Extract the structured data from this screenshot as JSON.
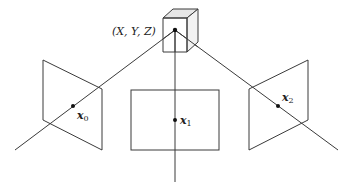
{
  "diagram": {
    "type": "multi-view camera geometry",
    "world_point": {
      "label": "(X, Y, Z)"
    },
    "views": [
      {
        "name": "view-0",
        "point_label": "x",
        "subscript": "0"
      },
      {
        "name": "view-1",
        "point_label": "x",
        "subscript": "1"
      },
      {
        "name": "view-2",
        "point_label": "x",
        "subscript": "2"
      }
    ],
    "colors": {
      "stroke": "#3a3a3a",
      "cube_top": "#e6e6e6",
      "cube_side": "#f0f0f0",
      "point": "#111111"
    }
  }
}
